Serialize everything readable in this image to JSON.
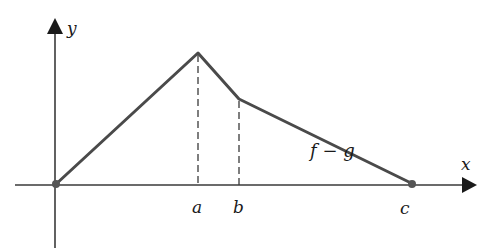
{
  "diagram": {
    "axes": {
      "x_label": "x",
      "y_label": "y",
      "origin": {
        "px": 55,
        "py": 185
      },
      "x_axis": {
        "x1": 15,
        "x2": 475,
        "y": 185
      },
      "y_axis": {
        "x": 55,
        "y1": 248,
        "y2": 18
      }
    },
    "curve": {
      "label": "f − g",
      "points": [
        {
          "name": "origin",
          "px": 55,
          "py": 185
        },
        {
          "name": "a",
          "px": 198,
          "py": 53
        },
        {
          "name": "b",
          "px": 239,
          "py": 99
        },
        {
          "name": "c",
          "px": 413,
          "py": 184
        }
      ],
      "color": "#4a4a4a"
    },
    "markers": {
      "a": "a",
      "b": "b",
      "c": "c"
    },
    "colors": {
      "axis": "#3a3a3a",
      "curve": "#4a4a4a",
      "dashes": "#3a3a3a",
      "dots": "#555555"
    }
  }
}
